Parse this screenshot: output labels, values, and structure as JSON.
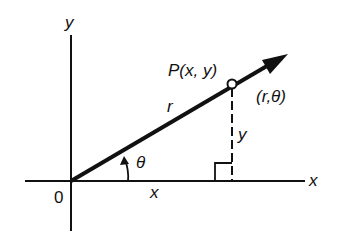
{
  "diagram": {
    "type": "polar-coordinates-figure",
    "colors": {
      "ink": "#111111",
      "background": "#ffffff"
    },
    "axes": {
      "x_label": "x",
      "y_label": "y",
      "origin_label": "0"
    },
    "point": {
      "cartesian_label": "P(x, y)",
      "polar_label": "(r,θ)"
    },
    "segments": {
      "radius_label": "r",
      "horizontal_label": "x",
      "vertical_label": "y",
      "angle_label": "θ"
    }
  }
}
